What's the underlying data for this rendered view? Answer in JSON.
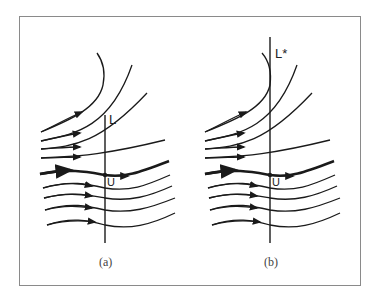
{
  "figure": {
    "panels": [
      {
        "id": "a",
        "caption": "(a)",
        "line_label": "L",
        "point_label": "U"
      },
      {
        "id": "b",
        "caption": "(b)",
        "line_label": "L*",
        "point_label": "U"
      }
    ]
  },
  "colors": {
    "stroke": "#1a1a1a",
    "frame": "#8a8a8a",
    "background": "#ffffff"
  }
}
